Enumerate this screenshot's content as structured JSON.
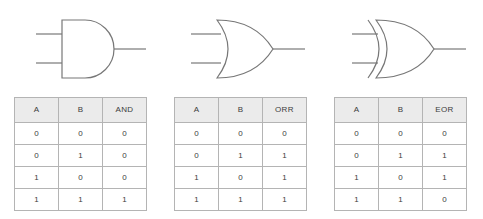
{
  "page": {
    "background_color": "#ffffff",
    "gate_stroke_color": "#777777",
    "table_border_color": "#b4b4b4",
    "header_background_color": "#ebebeb",
    "text_color": "#3c3c3c"
  },
  "gates": [
    {
      "name": "AND",
      "symbol_type": "and-gate",
      "inputs": 2,
      "outputs": 1
    },
    {
      "name": "OR",
      "symbol_type": "or-gate",
      "inputs": 2,
      "outputs": 1
    },
    {
      "name": "EOR",
      "symbol_type": "xor-gate",
      "inputs": 2,
      "outputs": 1
    }
  ],
  "tables": [
    {
      "id": "and",
      "headers": [
        "A",
        "B",
        "AND"
      ],
      "rows": [
        [
          "0",
          "0",
          "0"
        ],
        [
          "0",
          "1",
          "0"
        ],
        [
          "1",
          "0",
          "0"
        ],
        [
          "1",
          "1",
          "1"
        ]
      ]
    },
    {
      "id": "or",
      "headers": [
        "A",
        "B",
        "ORR"
      ],
      "rows": [
        [
          "0",
          "0",
          "0"
        ],
        [
          "0",
          "1",
          "1"
        ],
        [
          "1",
          "0",
          "1"
        ],
        [
          "1",
          "1",
          "1"
        ]
      ]
    },
    {
      "id": "eor",
      "headers": [
        "A",
        "B",
        "EOR"
      ],
      "rows": [
        [
          "0",
          "0",
          "0"
        ],
        [
          "0",
          "1",
          "1"
        ],
        [
          "1",
          "0",
          "1"
        ],
        [
          "1",
          "1",
          "0"
        ]
      ]
    }
  ]
}
